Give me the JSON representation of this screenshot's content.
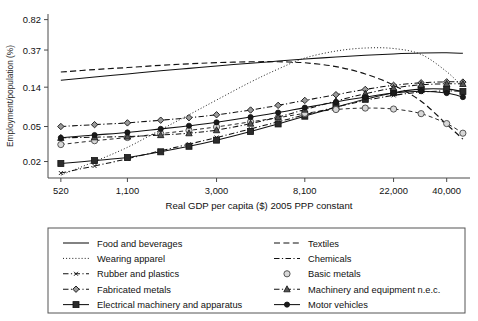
{
  "axes": {
    "ylabel": "Employment/population (%)",
    "xlabel": "Real GDP per capita ($) 2005 PPP constant",
    "yticks": [
      "0.82",
      "0.37",
      "0.14",
      "0.05",
      "0.02"
    ],
    "xticks": [
      "520",
      "1,100",
      "3,000",
      "8,100",
      "22,000",
      "40,000"
    ]
  },
  "legend": {
    "left": [
      {
        "label": "Food and beverages",
        "style": "solid",
        "marker": "none"
      },
      {
        "label": "Wearing apparel",
        "style": "dotted",
        "marker": "none"
      },
      {
        "label": "Rubber and plastics",
        "style": "dashdot",
        "marker": "tiny-x"
      },
      {
        "label": "Fabricated metals",
        "style": "dashdot",
        "marker": "diamond"
      },
      {
        "label": "Electrical machinery and apparatus",
        "style": "solid",
        "marker": "square"
      }
    ],
    "right": [
      {
        "label": "Textiles",
        "style": "dashed",
        "marker": "none"
      },
      {
        "label": "Chemicals",
        "style": "dashdot",
        "marker": "none"
      },
      {
        "label": "Basic metals",
        "style": "none",
        "marker": "open-circle"
      },
      {
        "label": "Machinery and equipment n.e.c.",
        "style": "dashdot",
        "marker": "triangle"
      },
      {
        "label": "Motor vehicles",
        "style": "solid",
        "marker": "filled-circle"
      }
    ]
  },
  "chart_data": {
    "type": "line",
    "title": "",
    "xlabel": "Real GDP per capita ($) 2005 PPP constant",
    "ylabel": "Employment/population (%)",
    "xscale": "log",
    "yscale": "log",
    "xlim": [
      450,
      52000
    ],
    "ylim": [
      0.013,
      0.95
    ],
    "xtick_values": [
      520,
      1100,
      3000,
      8100,
      22000,
      40000
    ],
    "ytick_values": [
      0.82,
      0.37,
      0.14,
      0.05,
      0.02
    ],
    "grid": false,
    "legend_position": "below-axes",
    "x": [
      520,
      760,
      1100,
      1600,
      2200,
      3000,
      4400,
      6000,
      8100,
      11500,
      16000,
      22000,
      30000,
      40000,
      48000
    ],
    "series": [
      {
        "name": "Food and beverages",
        "style": "solid",
        "marker": "none",
        "values": [
          0.168,
          0.183,
          0.198,
          0.215,
          0.229,
          0.244,
          0.262,
          0.277,
          0.292,
          0.308,
          0.322,
          0.334,
          0.342,
          0.344,
          0.34
        ]
      },
      {
        "name": "Wearing apparel",
        "style": "dotted",
        "marker": "none",
        "values": [
          0.014,
          0.02,
          0.029,
          0.046,
          0.068,
          0.1,
          0.16,
          0.225,
          0.3,
          0.36,
          0.39,
          0.385,
          0.33,
          0.21,
          0.14
        ]
      },
      {
        "name": "Textiles",
        "style": "dashed",
        "marker": "none",
        "values": [
          0.208,
          0.222,
          0.234,
          0.248,
          0.258,
          0.266,
          0.272,
          0.272,
          0.265,
          0.24,
          0.198,
          0.148,
          0.097,
          0.053,
          0.036
        ]
      },
      {
        "name": "Rubber and plastics",
        "style": "dashdot",
        "marker": "tiny-x",
        "values": [
          0.0148,
          0.0178,
          0.0215,
          0.0265,
          0.0315,
          0.0375,
          0.047,
          0.0565,
          0.068,
          0.083,
          0.099,
          0.113,
          0.123,
          0.127,
          0.1255
        ]
      },
      {
        "name": "Fabricated metals",
        "style": "dashdot",
        "marker": "diamond",
        "values": [
          0.05,
          0.0525,
          0.055,
          0.059,
          0.063,
          0.068,
          0.077,
          0.087,
          0.099,
          0.115,
          0.132,
          0.147,
          0.157,
          0.161,
          0.16
        ]
      },
      {
        "name": "Electrical machinery and apparatus",
        "style": "solid",
        "marker": "square",
        "values": [
          0.019,
          0.0205,
          0.0222,
          0.0258,
          0.0298,
          0.035,
          0.044,
          0.0535,
          0.0655,
          0.083,
          0.102,
          0.121,
          0.133,
          0.133,
          0.125
        ]
      },
      {
        "name": "Basic metals",
        "style": "none",
        "marker": "open-circle",
        "values": [
          0.0312,
          0.0345,
          0.0375,
          0.0415,
          0.0452,
          0.0495,
          0.0565,
          0.063,
          0.0705,
          0.078,
          0.081,
          0.079,
          0.07,
          0.054,
          0.042
        ]
      },
      {
        "name": "Machinery and equipment n.e.c.",
        "style": "dashdot",
        "marker": "triangle",
        "values": [
          0.0372,
          0.0378,
          0.0385,
          0.04,
          0.042,
          0.0455,
          0.054,
          0.064,
          0.078,
          0.0975,
          0.118,
          0.137,
          0.149,
          0.153,
          0.1525
        ]
      },
      {
        "name": "Motor vehicles",
        "style": "solid",
        "marker": "filled-circle",
        "values": [
          0.0372,
          0.04,
          0.0428,
          0.047,
          0.051,
          0.0558,
          0.064,
          0.072,
          0.082,
          0.095,
          0.108,
          0.12,
          0.126,
          0.12,
          0.108
        ]
      }
    ]
  }
}
